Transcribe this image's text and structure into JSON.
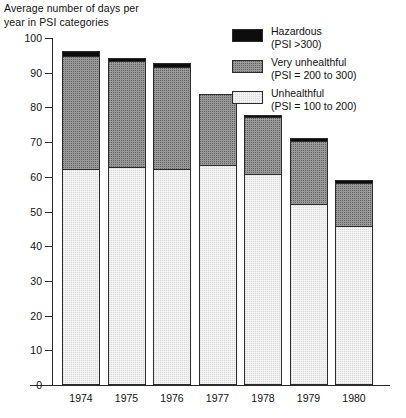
{
  "chart_data": {
    "type": "bar",
    "title": "Average number of days per\nyear in PSI categories",
    "xlabel": "",
    "ylabel": "",
    "ylim": [
      0,
      100
    ],
    "y_ticks": [
      0,
      10,
      20,
      30,
      40,
      50,
      60,
      70,
      80,
      90,
      100
    ],
    "grid": false,
    "stacked": true,
    "legend_position": "top-right",
    "categories": [
      "1974",
      "1975",
      "1976",
      "1977",
      "1978",
      "1979",
      "1980"
    ],
    "series": [
      {
        "name": "Unhealthful",
        "sublabel": "(PSI = 100 to 200)",
        "color": "#f2f2f2",
        "values": [
          62,
          62.5,
          62,
          63,
          60.5,
          52,
          45.5
        ]
      },
      {
        "name": "Very unhealthful",
        "sublabel": "(PSI = 200 to 300)",
        "color": "#9a9a9a",
        "values": [
          32.5,
          30.5,
          29.5,
          20.5,
          16.5,
          18,
          12.5
        ]
      },
      {
        "name": "Hazardous",
        "sublabel": "(PSI >300)",
        "color": "#0d0d0d",
        "values": [
          1.5,
          1,
          1,
          0,
          0.5,
          0.8,
          0.8
        ]
      }
    ],
    "totals": [
      96,
      94,
      92.5,
      83.5,
      77.5,
      70.8,
      58.8
    ]
  },
  "legend": {
    "items": [
      {
        "label": "Hazardous",
        "sublabel": "(PSI >300)",
        "swatch": "hazardous-swatch"
      },
      {
        "label": "Very unhealthful",
        "sublabel": "(PSI = 200 to 300)",
        "swatch": "very-unhealthful-swatch"
      },
      {
        "label": "Unhealthful",
        "sublabel": "(PSI = 100 to 200)",
        "swatch": "unhealthful-swatch"
      }
    ]
  },
  "axis": {
    "y_labels": [
      "100",
      "90",
      "80",
      "70",
      "60",
      "50",
      "40",
      "30",
      "20",
      "10",
      "0"
    ],
    "x_labels": [
      "1974",
      "1975",
      "1976",
      "1977",
      "1978",
      "1979",
      "1980"
    ]
  }
}
